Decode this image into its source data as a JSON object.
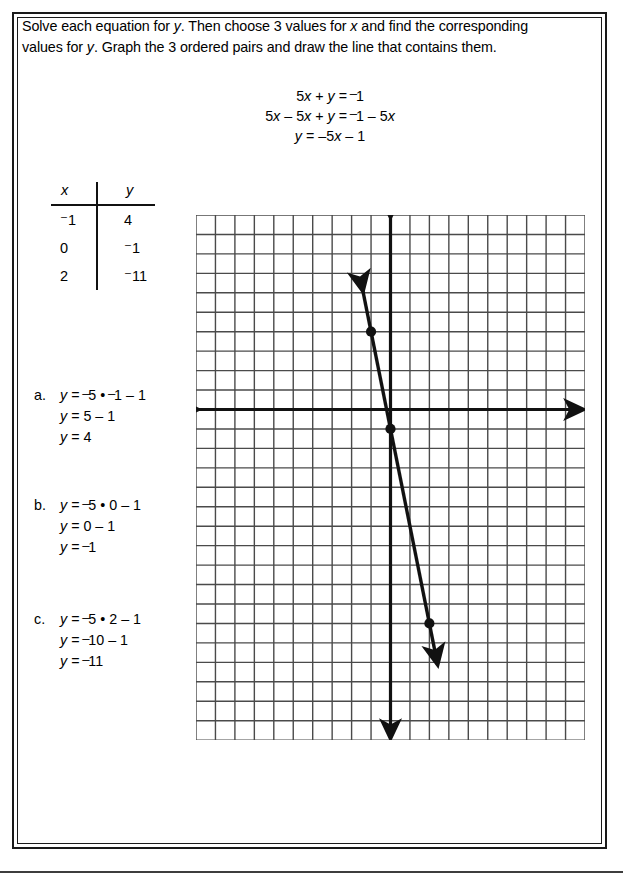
{
  "worksheet": {
    "instructions": {
      "seg1": "Solve each equation for ",
      "var_y1": "y",
      "seg2": ". Then choose 3 values for ",
      "var_x": "x",
      "seg3": " and find the corresponding values for ",
      "var_y2": "y",
      "seg4": ". Graph the 3 ordered pairs and draw the line that contains them."
    },
    "equation_block": {
      "lines": [
        "5x + y = ⁻1",
        "5x – 5x + y = ⁻1 – 5x",
        "y = –5x – 1"
      ],
      "line1": {
        "a": "5",
        "x": "x",
        "b": " + ",
        "y": "y",
        "c": " = ",
        "neg": "1"
      },
      "line2": {
        "a": "5",
        "x1": "x",
        "b": " – 5",
        "x2": "x",
        "c": " + ",
        "y": "y",
        "d": " = ",
        "neg1": "1",
        "e": " – 5",
        "x3": "x"
      },
      "line3": {
        "y": "y",
        "a": " = –5",
        "x": "x",
        "b": " – 1"
      }
    },
    "table": {
      "header_x": "x",
      "header_y": "y",
      "rows": [
        {
          "x": "⁻1",
          "y": "4"
        },
        {
          "x": "0",
          "y": "⁻1"
        },
        {
          "x": "2",
          "y": "⁻11"
        }
      ],
      "x_values": [
        "-1",
        "0",
        "2"
      ],
      "y_values": [
        "4",
        "-1",
        "-11"
      ]
    },
    "solutions": [
      {
        "letter": "a.",
        "steps": [
          "y = ⁻5 • ⁻1 – 1",
          "y = 5 – 1",
          "y = 4"
        ],
        "step_parts": [
          {
            "y": "y",
            "t1": " = ",
            "n1": "5",
            "t2": " • ",
            "n2": "1",
            "t3": " – 1"
          },
          {
            "y": "y",
            "t1": " = 5 – 1"
          },
          {
            "y": "y",
            "t1": " = 4"
          }
        ]
      },
      {
        "letter": "b.",
        "steps": [
          "y = ⁻5 • 0 – 1",
          "y = 0 – 1",
          "y = ⁻1"
        ],
        "step_parts": [
          {
            "y": "y",
            "t1": " = ",
            "n1": "5",
            "t2": " • 0 – 1"
          },
          {
            "y": "y",
            "t1": " = 0 – 1"
          },
          {
            "y": "y",
            "t1": " = ",
            "n1": "1"
          }
        ]
      },
      {
        "letter": "c.",
        "steps": [
          "y = ⁻5 • 2 – 1",
          "y = ⁻10 – 1",
          "y = ⁻11"
        ],
        "step_parts": [
          {
            "y": "y",
            "t1": " = ",
            "n1": "5",
            "t2": " • 2 – 1"
          },
          {
            "y": "y",
            "t1": " = ",
            "n1": "10 – 1"
          },
          {
            "y": "y",
            "t1": " = ",
            "n1": "11"
          }
        ]
      }
    ]
  },
  "chart_data": {
    "type": "line",
    "title": "",
    "xlabel": "x",
    "ylabel": "y",
    "grid": true,
    "legend": false,
    "equation": "y = -5x - 1",
    "slope": -5,
    "intercept": -1,
    "xlim": [
      -10,
      10
    ],
    "ylim": [
      -17,
      10
    ],
    "grid_columns": 20,
    "grid_rows": 27,
    "cell_px": 19.45,
    "origin_col": 10,
    "origin_row": 10,
    "points": [
      {
        "x": -1,
        "y": 4
      },
      {
        "x": 0,
        "y": -1
      },
      {
        "x": 2,
        "y": -11
      }
    ],
    "series": [
      {
        "name": "y = -5x - 1",
        "x": [
          -1,
          0,
          2
        ],
        "values": [
          4,
          -1,
          -11
        ]
      }
    ],
    "axes": {
      "x_axis_arrow_both_ends": true,
      "y_axis_arrow_both_ends": true
    },
    "line_arrow_both_ends": true
  },
  "colors": {
    "ink": "#111111",
    "grid": "#4a4a4a",
    "paper": "#ffffff",
    "frame": "#1a1a1a"
  }
}
